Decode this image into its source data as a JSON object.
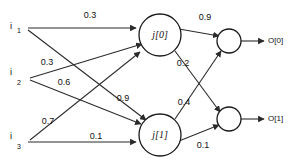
{
  "diagram": {
    "type": "neural-network",
    "colors": {
      "background": "#ffffff",
      "stroke": "#2b2b2b",
      "node_stroke": "#1a1a1a",
      "text": "#111111"
    },
    "input_layer": {
      "nodes": [
        {
          "id": "i1",
          "base": "i",
          "subscript": "1",
          "x": 14,
          "y": 28
        },
        {
          "id": "i2",
          "base": "i",
          "subscript": "2",
          "x": 14,
          "y": 78
        },
        {
          "id": "i3",
          "base": "i",
          "subscript": "3",
          "x": 14,
          "y": 140
        }
      ]
    },
    "hidden_layer": {
      "nodes": [
        {
          "id": "j0",
          "label": "j[0]",
          "cx": 160,
          "cy": 35,
          "r": 21
        },
        {
          "id": "j1",
          "label": "j[1]",
          "cx": 160,
          "cy": 135,
          "r": 21
        }
      ]
    },
    "output_layer": {
      "nodes": [
        {
          "id": "o0",
          "cx": 229,
          "cy": 41,
          "r": 12
        },
        {
          "id": "o1",
          "cx": 229,
          "cy": 119,
          "r": 12
        }
      ],
      "labels": [
        {
          "id": "O0",
          "text": "O[0]",
          "x": 276,
          "y": 41
        },
        {
          "id": "O1",
          "text": "O[1]",
          "x": 276,
          "y": 119
        }
      ]
    },
    "edges": [
      {
        "id": "e-i1-j0",
        "from": "i1",
        "to": "j0",
        "weight": "0.3",
        "label_x": 90,
        "label_y": 16
      },
      {
        "id": "e-i1-j1",
        "from": "i1",
        "to": "j1",
        "weight": "0.9",
        "label_x": 123,
        "label_y": 99
      },
      {
        "id": "e-i2-j0",
        "from": "i2",
        "to": "j0",
        "weight": "0.3",
        "label_x": 47,
        "label_y": 63
      },
      {
        "id": "e-i2-j1",
        "from": "i2",
        "to": "j1",
        "weight": "0.6",
        "label_x": 64,
        "label_y": 83
      },
      {
        "id": "e-i3-j0",
        "from": "i3",
        "to": "j0",
        "weight": "0.7",
        "label_x": 48,
        "label_y": 122
      },
      {
        "id": "e-i3-j1",
        "from": "i3",
        "to": "j1",
        "weight": "0.1",
        "label_x": 96,
        "label_y": 137
      },
      {
        "id": "e-j0-o0",
        "from": "j0",
        "to": "o0",
        "weight": "0.9",
        "label_x": 205,
        "label_y": 18
      },
      {
        "id": "e-j0-o1",
        "from": "j0",
        "to": "o1",
        "weight": "0.2",
        "label_x": 183,
        "label_y": 64
      },
      {
        "id": "e-j1-o0",
        "from": "j1",
        "to": "o0",
        "weight": "0.4",
        "label_x": 184,
        "label_y": 103
      },
      {
        "id": "e-j1-o1",
        "from": "j1",
        "to": "o1",
        "weight": "0.1",
        "label_x": 203,
        "label_y": 146
      }
    ]
  }
}
